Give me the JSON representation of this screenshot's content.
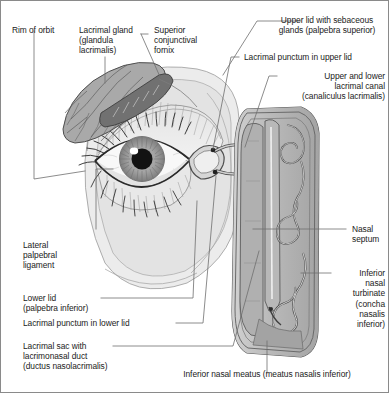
{
  "figure": {
    "kind": "anatomical-diagram",
    "border_color": "#8a8a8a",
    "background_color": "#ffffff",
    "text_color": "#1a1a1a",
    "leader_line_color": "#6f6f6f"
  },
  "labels": {
    "rim_of_orbit": "Rim of orbit",
    "lacrimal_gland": "Lacrimal gland\n(glandula\nlacrimalis)",
    "superior_fornix": "Superior\nconjunctival\nfornix",
    "upper_lid": "Upper lid with sebaceous\nglands (palpebra superior)",
    "punctum_upper": "Lacrimal punctum in upper lid",
    "lacrimal_canal": "Upper and lower\nlacrimal canal\n(canaliculus lacrimalis)",
    "nasal_septum": "Nasal\nseptum",
    "inferior_turbinate": "Inferior\nnasal\nturbinate\n(concha\nnasalis\ninferior)",
    "lateral_palpebral_ligament": "Lateral\npalpebral\nligament",
    "lower_lid": "Lower lid\n(palpebra inferior)",
    "punctum_lower": "Lacrimal punctum in lower lid",
    "lacrimal_sac": "Lacrimal sac with\nlacrimonasal duct\n(ductus nasolacrimalis)",
    "inferior_meatus": "Inferior nasal meatus (meatus nasalis inferior)"
  },
  "palette": {
    "eye_skin": "#e9e9e9",
    "eye_skin_2": "#dedede",
    "sclera": "#f7f7f7",
    "iris": "#a9a9a9",
    "iris_dark": "#8d8d8d",
    "pupil": "#141414",
    "highlight": "#ffffff",
    "gland_fill": "#a8a8a8",
    "gland_edge": "#5a5a5a",
    "duct_fill": "#cfcfcf",
    "nasal_outer": "#c9c9c9",
    "nasal_mid": "#b5b5b5",
    "nasal_inner": "#9d9d9d",
    "nasal_dark": "#8a8a8a",
    "lash": "#242424",
    "outline": "#4a4a4a"
  }
}
